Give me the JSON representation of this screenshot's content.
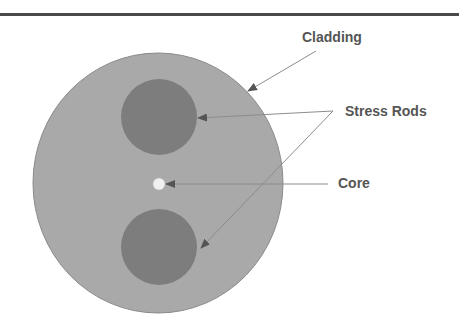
{
  "diagram": {
    "type": "fiber-cross-section",
    "labels": {
      "cladding": "Cladding",
      "stress_rods": "Stress Rods",
      "core": "Core"
    },
    "colors": {
      "cladding": "#a9a9a9",
      "cladding_edge": "#8a8a8a",
      "stress_rod": "#7d7d7d",
      "core": "#f0f0f0",
      "leader_line": "#8c8c8c",
      "arrowhead": "#555555",
      "label_text": "#555555",
      "rule": "#4a4a4a"
    }
  }
}
